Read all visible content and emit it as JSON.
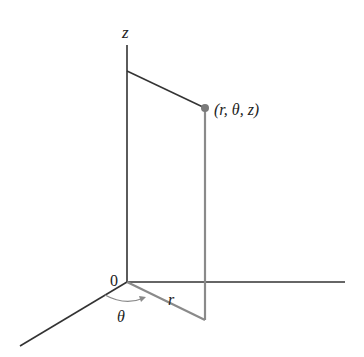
{
  "diagram": {
    "labels": {
      "z_axis": "z",
      "origin": "0",
      "point": "(r, θ, z)",
      "radius": "r",
      "angle": "θ"
    },
    "colors": {
      "axis": "#333333",
      "construction": "#8a8a8a",
      "point": "#7a7a7a",
      "text": "#222222"
    }
  }
}
